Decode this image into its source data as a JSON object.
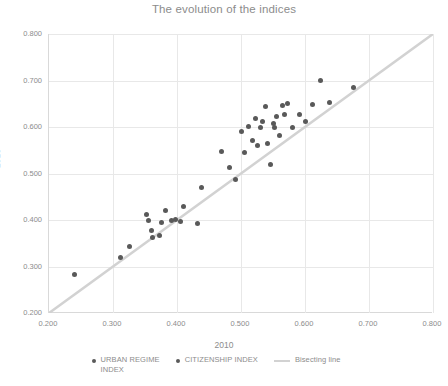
{
  "chart_data": {
    "type": "scatter",
    "title": "The evolution of the indices",
    "xlabel": "2010",
    "ylabel": "2016",
    "xlim": [
      0.2,
      0.8
    ],
    "ylim": [
      0.2,
      0.8
    ],
    "grid": true,
    "legend_position": "bottom",
    "xticks": [
      "0.200",
      "0.300",
      "0.400",
      "0.500",
      "0.600",
      "0.700",
      "0.800"
    ],
    "yticks": [
      "0.200",
      "0.300",
      "0.400",
      "0.500",
      "0.600",
      "0.700",
      "0.800"
    ],
    "xtick_values": [
      0.2,
      0.3,
      0.4,
      0.5,
      0.6,
      0.7,
      0.8
    ],
    "ytick_values": [
      0.2,
      0.3,
      0.4,
      0.5,
      0.6,
      0.7,
      0.8
    ],
    "series": [
      {
        "name": "URBAN REGIME INDEX",
        "marker": "circle",
        "color": "#595959",
        "points": [
          [
            0.24,
            0.282
          ],
          [
            0.312,
            0.32
          ],
          [
            0.325,
            0.344
          ],
          [
            0.352,
            0.412
          ],
          [
            0.356,
            0.398
          ],
          [
            0.36,
            0.378
          ],
          [
            0.362,
            0.362
          ],
          [
            0.372,
            0.366
          ],
          [
            0.375,
            0.395
          ],
          [
            0.382,
            0.42
          ],
          [
            0.392,
            0.4
          ],
          [
            0.398,
            0.402
          ],
          [
            0.405,
            0.396
          ],
          [
            0.41,
            0.43
          ],
          [
            0.432,
            0.392
          ],
          [
            0.438,
            0.47
          ],
          [
            0.47,
            0.548
          ],
          [
            0.482,
            0.512
          ],
          [
            0.492,
            0.488
          ]
        ]
      },
      {
        "name": "CITIZENSHIP INDEX",
        "marker": "circle",
        "color": "#595959",
        "points": [
          [
            0.5,
            0.59
          ],
          [
            0.505,
            0.545
          ],
          [
            0.512,
            0.602
          ],
          [
            0.518,
            0.572
          ],
          [
            0.522,
            0.618
          ],
          [
            0.525,
            0.56
          ],
          [
            0.53,
            0.6
          ],
          [
            0.534,
            0.612
          ],
          [
            0.538,
            0.645
          ],
          [
            0.542,
            0.565
          ],
          [
            0.546,
            0.52
          ],
          [
            0.55,
            0.608
          ],
          [
            0.552,
            0.598
          ],
          [
            0.556,
            0.622
          ],
          [
            0.56,
            0.582
          ],
          [
            0.564,
            0.646
          ],
          [
            0.568,
            0.626
          ],
          [
            0.572,
            0.65
          ],
          [
            0.58,
            0.6
          ],
          [
            0.592,
            0.628
          ],
          [
            0.6,
            0.612
          ],
          [
            0.612,
            0.648
          ],
          [
            0.624,
            0.7
          ],
          [
            0.638,
            0.652
          ],
          [
            0.675,
            0.685
          ]
        ]
      }
    ],
    "reference_line": {
      "name": "Bisecting line",
      "color": "#d2d2d2",
      "from": [
        0.2,
        0.2
      ],
      "to": [
        0.8,
        0.8
      ]
    }
  },
  "legend": {
    "items": [
      {
        "label": "URBAN REGIME\nINDEX",
        "type": "dot"
      },
      {
        "label": "CITIZENSHIP INDEX",
        "type": "dot"
      },
      {
        "label": "Bisecting line",
        "type": "line"
      }
    ]
  }
}
